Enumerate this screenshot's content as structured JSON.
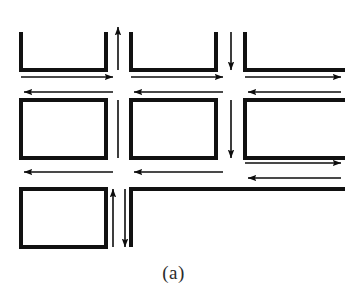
{
  "figure": {
    "caption": "(a)",
    "title": "",
    "kind": "street-network-traffic-flow-diagram",
    "colors": {
      "background": "#ffffff",
      "block_stroke": "#111111",
      "arrow_stroke": "#0d0d0d",
      "caption_text": "#2b2b2b"
    },
    "stroke_widths": {
      "block_border": 4,
      "arrow_line": 1.6
    },
    "canvas": {
      "width": 347,
      "height": 304,
      "diagram_height": 266
    }
  },
  "blocks": [
    {
      "name": "block-top-left",
      "shape": "open-top",
      "x": 21,
      "y": 32,
      "width": 85,
      "height": 38
    },
    {
      "name": "block-top-middle",
      "shape": "open-top",
      "x": 131,
      "y": 32,
      "width": 85,
      "height": 38
    },
    {
      "name": "block-top-right",
      "shape": "open-top-right",
      "x": 245,
      "y": 32,
      "width": 96,
      "height": 38
    },
    {
      "name": "block-middle-left",
      "shape": "closed",
      "x": 21,
      "y": 100,
      "width": 85,
      "height": 58
    },
    {
      "name": "block-middle-middle",
      "shape": "closed",
      "x": 131,
      "y": 100,
      "width": 85,
      "height": 58
    },
    {
      "name": "block-middle-right",
      "shape": "open-right",
      "x": 245,
      "y": 100,
      "width": 96,
      "height": 58
    },
    {
      "name": "block-bottom-left",
      "shape": "closed",
      "x": 21,
      "y": 189,
      "width": 85,
      "height": 58
    },
    {
      "name": "block-bottom-right",
      "shape": "open-bottom-right",
      "x": 131,
      "y": 189,
      "width": 210,
      "height": 58
    }
  ],
  "flow_arrows": [
    {
      "name": "arrow-h-top-row-eastbound-left",
      "direction": "east",
      "orientation": "horizontal",
      "x1": 21,
      "x2": 113,
      "y": 77
    },
    {
      "name": "arrow-h-top-row-eastbound-middle",
      "direction": "east",
      "orientation": "horizontal",
      "x1": 131,
      "x2": 223,
      "y": 77
    },
    {
      "name": "arrow-h-top-row-eastbound-right",
      "direction": "east",
      "orientation": "horizontal",
      "x1": 245,
      "x2": 341,
      "y": 77
    },
    {
      "name": "arrow-h-top-row-westbound-left",
      "direction": "west",
      "orientation": "horizontal",
      "x1": 113,
      "x2": 24,
      "y": 92
    },
    {
      "name": "arrow-h-top-row-westbound-middle",
      "direction": "west",
      "orientation": "horizontal",
      "x1": 223,
      "x2": 134,
      "y": 92
    },
    {
      "name": "arrow-h-top-row-westbound-right",
      "direction": "west",
      "orientation": "horizontal",
      "x1": 341,
      "x2": 248,
      "y": 92
    },
    {
      "name": "arrow-h-mid-row-westbound-left",
      "direction": "west",
      "orientation": "horizontal",
      "x1": 113,
      "x2": 24,
      "y": 172
    },
    {
      "name": "arrow-h-mid-row-westbound-middle",
      "direction": "west",
      "orientation": "horizontal",
      "x1": 223,
      "x2": 134,
      "y": 172
    },
    {
      "name": "arrow-h-mid-row-eastbound-right",
      "direction": "east",
      "orientation": "horizontal",
      "x1": 245,
      "x2": 341,
      "y": 163
    },
    {
      "name": "arrow-h-mid-row-westbound-right",
      "direction": "west",
      "orientation": "horizontal",
      "x1": 341,
      "x2": 248,
      "y": 178
    },
    {
      "name": "arrow-v-left-avenue-northbound",
      "direction": "north",
      "orientation": "vertical",
      "x": 118,
      "y1": 70,
      "y2": 27
    },
    {
      "name": "arrow-v-left-avenue-link",
      "direction": "none",
      "orientation": "vertical",
      "x": 118,
      "y1": 100,
      "y2": 158
    },
    {
      "name": "arrow-v-left-avenue-lower-northbound",
      "direction": "north",
      "orientation": "vertical",
      "x": 113,
      "y1": 247,
      "y2": 189
    },
    {
      "name": "arrow-v-left-avenue-lower-southbound",
      "direction": "south",
      "orientation": "vertical",
      "x": 125,
      "y1": 189,
      "y2": 247
    },
    {
      "name": "arrow-v-right-avenue-southbound-top",
      "direction": "south",
      "orientation": "vertical",
      "x": 231,
      "y1": 32,
      "y2": 70
    },
    {
      "name": "arrow-v-right-avenue-southbound-mid",
      "direction": "south",
      "orientation": "vertical",
      "x": 231,
      "y1": 100,
      "y2": 158
    }
  ]
}
